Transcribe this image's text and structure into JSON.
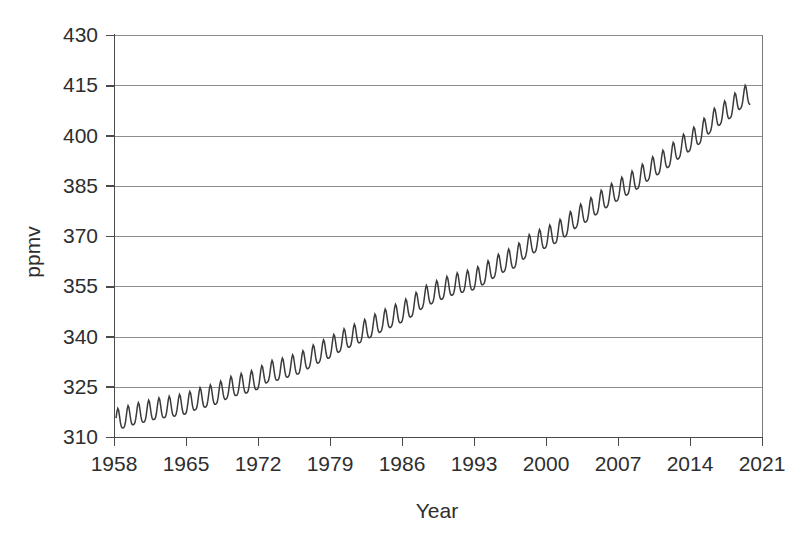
{
  "chart_data": {
    "type": "line",
    "title": "",
    "subtitle": "",
    "xlabel": "Year",
    "ylabel": "ppmv",
    "xlim": [
      1958,
      2021
    ],
    "ylim": [
      310,
      430
    ],
    "xticks": [
      1958,
      1965,
      1972,
      1979,
      1986,
      1993,
      2000,
      2007,
      2014,
      2021
    ],
    "yticks": [
      310,
      325,
      340,
      355,
      370,
      385,
      400,
      415,
      430
    ],
    "xtick_labels": [
      "1958",
      "1965",
      "1972",
      "1979",
      "1986",
      "1993",
      "2000",
      "2007",
      "2014",
      "2021"
    ],
    "ytick_labels": [
      "310",
      "325",
      "340",
      "355",
      "370",
      "385",
      "400",
      "415",
      "430"
    ],
    "grid": "horizontal",
    "legend": "none",
    "annotations": [],
    "series": [
      {
        "name": "Atmospheric CO2 concentration",
        "color": "#3a3a3a",
        "seasonal_amplitude_ppmv": 3.1,
        "seasonal_peak_month": 5,
        "x_start": 1958.2,
        "x_end": 2019.9,
        "x": [
          1958.2,
          1959,
          1960,
          1961,
          1962,
          1963,
          1964,
          1965,
          1966,
          1967,
          1968,
          1969,
          1970,
          1971,
          1972,
          1973,
          1974,
          1975,
          1976,
          1977,
          1978,
          1979,
          1980,
          1981,
          1982,
          1983,
          1984,
          1985,
          1986,
          1987,
          1988,
          1989,
          1990,
          1991,
          1992,
          1993,
          1994,
          1995,
          1996,
          1997,
          1998,
          1999,
          2000,
          2001,
          2002,
          2003,
          2004,
          2005,
          2006,
          2007,
          2008,
          2009,
          2010,
          2011,
          2012,
          2013,
          2014,
          2015,
          2016,
          2017,
          2018,
          2019,
          2019.9
        ],
        "values": [
          315.3,
          315.9,
          316.9,
          317.6,
          318.4,
          318.9,
          319.4,
          320.0,
          321.3,
          322.1,
          323.0,
          324.6,
          325.6,
          326.3,
          327.4,
          329.6,
          330.1,
          331.1,
          332.0,
          333.8,
          335.4,
          336.8,
          338.7,
          340.1,
          341.4,
          343.0,
          344.6,
          346.0,
          347.4,
          349.2,
          351.6,
          353.1,
          354.4,
          355.6,
          356.4,
          357.1,
          358.8,
          360.8,
          362.6,
          363.7,
          366.7,
          368.4,
          369.6,
          371.1,
          373.2,
          375.8,
          377.5,
          379.8,
          381.9,
          383.8,
          385.6,
          387.4,
          389.9,
          391.7,
          393.9,
          396.5,
          398.6,
          400.8,
          404.2,
          406.5,
          408.5,
          411.4,
          412.5
        ]
      }
    ]
  },
  "axes": {
    "y_axis_title": "ppmv",
    "x_axis_title": "Year"
  }
}
